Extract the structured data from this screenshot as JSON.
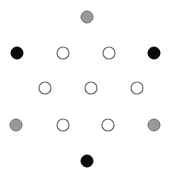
{
  "diagram": {
    "width": 174,
    "height": 179,
    "background": "#ffffff",
    "radius": 6,
    "styles": {
      "gray": {
        "fill": "#9a9a9a",
        "stroke": "#6e6e6e"
      },
      "black": {
        "fill": "#0a0a0a",
        "stroke": "#000000"
      },
      "white": {
        "fill": "#ffffff",
        "stroke": "#6a6a6a"
      }
    },
    "nodes": [
      {
        "id": "top",
        "x": 87,
        "y": 17,
        "style": "gray"
      },
      {
        "id": "row2-left",
        "x": 17,
        "y": 53,
        "style": "black"
      },
      {
        "id": "row2-inner-left",
        "x": 63,
        "y": 53,
        "style": "white"
      },
      {
        "id": "row2-inner-right",
        "x": 109,
        "y": 53,
        "style": "white"
      },
      {
        "id": "row2-right",
        "x": 154,
        "y": 53,
        "style": "black"
      },
      {
        "id": "row3-left",
        "x": 45,
        "y": 88,
        "style": "white"
      },
      {
        "id": "row3-center",
        "x": 91,
        "y": 88,
        "style": "white"
      },
      {
        "id": "row3-right",
        "x": 137,
        "y": 88,
        "style": "white"
      },
      {
        "id": "row4-left",
        "x": 16,
        "y": 125,
        "style": "gray"
      },
      {
        "id": "row4-inner-left",
        "x": 63,
        "y": 125,
        "style": "white"
      },
      {
        "id": "row4-inner-right",
        "x": 108,
        "y": 125,
        "style": "white"
      },
      {
        "id": "row4-right",
        "x": 154,
        "y": 125,
        "style": "gray"
      },
      {
        "id": "bottom",
        "x": 87,
        "y": 161,
        "style": "black"
      }
    ]
  }
}
